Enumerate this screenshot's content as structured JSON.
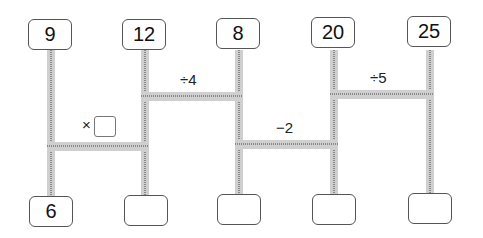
{
  "top_numbers": [
    "9",
    "12",
    "8",
    "20",
    "25"
  ],
  "bottom_numbers": [
    "6",
    "",
    "",
    "",
    ""
  ],
  "operations": [
    {
      "label": "×",
      "between": [
        1,
        2
      ],
      "has_blank": true
    },
    {
      "label": "÷4",
      "between": [
        2,
        3
      ],
      "has_blank": false
    },
    {
      "label": "−2",
      "between": [
        3,
        4
      ],
      "has_blank": false
    },
    {
      "label": "÷5",
      "between": [
        4,
        5
      ],
      "has_blank": false
    }
  ],
  "colors": {
    "rail": "#cfcfcf",
    "rail_dots": "#8a8a8a",
    "box_border": "#555555"
  }
}
